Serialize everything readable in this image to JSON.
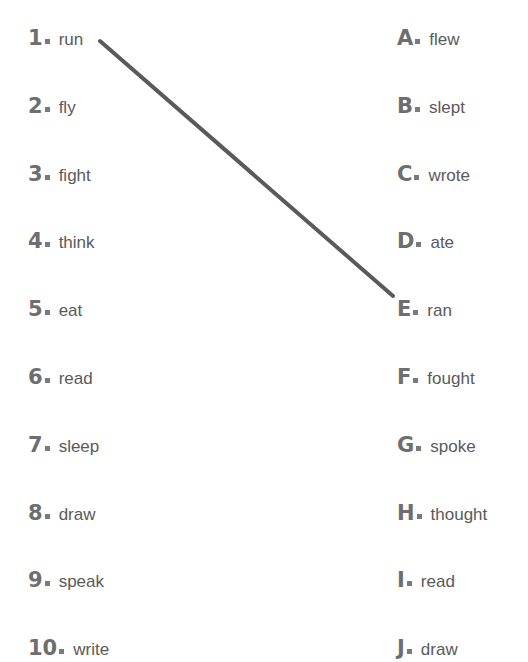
{
  "exercise": {
    "title": "Irregular verbs matching exercise",
    "type": "matching-exercise",
    "text_color": "#5a5a5a",
    "marker_color": "#6e6e6e",
    "background_color": "#ffffff",
    "connector_color": "#5a5a5a"
  },
  "left_column": {
    "name": "base-verbs",
    "items": [
      {
        "marker": "1",
        "word": "run"
      },
      {
        "marker": "2",
        "word": "fly"
      },
      {
        "marker": "3",
        "word": "fight"
      },
      {
        "marker": "4",
        "word": "think"
      },
      {
        "marker": "5",
        "word": "eat"
      },
      {
        "marker": "6",
        "word": "read"
      },
      {
        "marker": "7",
        "word": "sleep"
      },
      {
        "marker": "8",
        "word": "draw"
      },
      {
        "marker": "9",
        "word": "speak"
      },
      {
        "marker": "10",
        "word": "write"
      }
    ]
  },
  "right_column": {
    "name": "past-tense-verbs",
    "items": [
      {
        "marker": "A",
        "word": "flew"
      },
      {
        "marker": "B",
        "word": "slept"
      },
      {
        "marker": "C",
        "word": "wrote"
      },
      {
        "marker": "D",
        "word": "ate"
      },
      {
        "marker": "E",
        "word": "ran"
      },
      {
        "marker": "F",
        "word": "fought"
      },
      {
        "marker": "G",
        "word": "spoke"
      },
      {
        "marker": "H",
        "word": "thought"
      },
      {
        "marker": "I",
        "word": "read"
      },
      {
        "marker": "J",
        "word": "draw"
      }
    ]
  },
  "connections": [
    {
      "from_marker": "1",
      "from_word": "run",
      "to_marker": "E",
      "to_word": "ran",
      "x1": 100,
      "y1": 41,
      "x2": 393,
      "y2": 296,
      "stroke": "#5a5a5a",
      "stroke_width": 4
    }
  ]
}
